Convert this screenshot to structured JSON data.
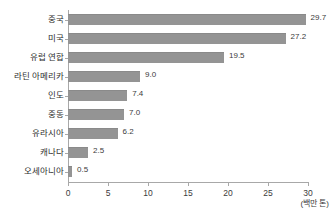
{
  "chart_data": {
    "type": "bar",
    "orientation": "horizontal",
    "title": "",
    "xlabel": "(백만 톤)",
    "ylabel": "",
    "categories": [
      "중국",
      "미국",
      "유럽 연합",
      "라틴 아메리카",
      "인도",
      "중동",
      "유라시아",
      "캐나다",
      "오세아니아"
    ],
    "values": [
      29.7,
      27.2,
      19.5,
      9.0,
      7.4,
      7.0,
      6.2,
      2.5,
      0.5
    ],
    "value_labels": [
      "29.7",
      "27.2",
      "19.5",
      "9.0",
      "7.4",
      "7.0",
      "6.2",
      "2.5",
      "0.5"
    ],
    "xlim": [
      0,
      30
    ],
    "xticks": [
      0,
      5,
      10,
      15,
      20,
      25,
      30
    ],
    "xtick_labels": [
      "0",
      "5",
      "10",
      "15",
      "20",
      "25",
      "30"
    ],
    "grid": false,
    "legend": null,
    "bar_color": "#949494",
    "axis_color": "#a8a8a8",
    "text_color": "#3b3b3b",
    "background": "#ffffff"
  }
}
